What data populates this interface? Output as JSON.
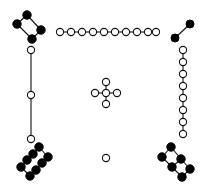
{
  "figure": {
    "width": 208,
    "height": 194,
    "background": "#ffffff",
    "colors": {
      "stroke": "#111111",
      "filled": "#000000",
      "open": "#ffffff"
    },
    "components": [
      {
        "name": "top-left-filled-ring",
        "node_style": "filled",
        "r": 4.2,
        "nodes": [
          [
            27,
            15
          ],
          [
            17,
            24
          ],
          [
            41,
            30
          ],
          [
            32,
            39
          ]
        ],
        "edges": [
          [
            0,
            1
          ],
          [
            0,
            2
          ],
          [
            1,
            3
          ],
          [
            2,
            3
          ]
        ]
      },
      {
        "name": "top-horizontal-chain",
        "node_style": "open",
        "r": 3.6,
        "nodes": [
          [
            60,
            32
          ],
          [
            71,
            32
          ],
          [
            82,
            32
          ],
          [
            93,
            32
          ],
          [
            104,
            32
          ],
          [
            115,
            32
          ],
          [
            126,
            32
          ],
          [
            137,
            32
          ],
          [
            148,
            32
          ],
          [
            156,
            32
          ]
        ],
        "edges": [
          [
            0,
            1
          ],
          [
            1,
            2
          ],
          [
            2,
            3
          ],
          [
            3,
            4
          ],
          [
            4,
            5
          ],
          [
            5,
            6
          ],
          [
            6,
            7
          ],
          [
            7,
            8
          ],
          [
            8,
            9
          ]
        ]
      },
      {
        "name": "top-right-filled-pair",
        "node_style": "filled",
        "r": 4.0,
        "nodes": [
          [
            175,
            38
          ],
          [
            190,
            24
          ]
        ],
        "edges": [
          [
            0,
            1
          ]
        ]
      },
      {
        "name": "left-vertical-chain",
        "node_style": "open",
        "r": 3.6,
        "nodes": [
          [
            31,
            50
          ],
          [
            31,
            95
          ],
          [
            31,
            139
          ]
        ],
        "edges": [
          [
            0,
            1
          ],
          [
            1,
            2
          ]
        ]
      },
      {
        "name": "right-vertical-chain",
        "node_style": "open",
        "r": 3.6,
        "nodes": [
          [
            183,
            50
          ],
          [
            183,
            62
          ],
          [
            183,
            74
          ],
          [
            183,
            86
          ],
          [
            183,
            98
          ],
          [
            183,
            110
          ],
          [
            183,
            122
          ],
          [
            183,
            134
          ]
        ],
        "edges": [
          [
            0,
            1
          ],
          [
            1,
            2
          ],
          [
            2,
            3
          ],
          [
            3,
            4
          ],
          [
            4,
            5
          ],
          [
            5,
            6
          ],
          [
            6,
            7
          ]
        ]
      },
      {
        "name": "center-cross",
        "node_style": "open",
        "r": 3.6,
        "nodes": [
          [
            106,
            93
          ],
          [
            106,
            82
          ],
          [
            95,
            93
          ],
          [
            117,
            93
          ],
          [
            106,
            104
          ]
        ],
        "edges": [
          [
            0,
            1
          ],
          [
            0,
            2
          ],
          [
            0,
            3
          ],
          [
            0,
            4
          ]
        ]
      },
      {
        "name": "bottom-left-filled-ladder",
        "node_style": "filled",
        "r": 4.2,
        "nodes": [
          [
            39,
            147
          ],
          [
            33,
            154
          ],
          [
            27,
            160
          ],
          [
            21,
            167
          ],
          [
            48,
            157
          ],
          [
            42,
            163
          ],
          [
            36,
            170
          ],
          [
            30,
            176
          ]
        ],
        "edges": [
          [
            0,
            1
          ],
          [
            1,
            2
          ],
          [
            2,
            3
          ],
          [
            4,
            5
          ],
          [
            5,
            6
          ],
          [
            6,
            7
          ],
          [
            0,
            4
          ],
          [
            3,
            7
          ]
        ]
      },
      {
        "name": "bottom-right-filled-ring",
        "node_style": "filled",
        "r": 4.2,
        "nodes": [
          [
            171,
            147
          ],
          [
            162,
            157
          ],
          [
            181,
            159
          ],
          [
            172,
            167
          ],
          [
            190,
            169
          ],
          [
            182,
            177
          ]
        ],
        "edges": [
          [
            0,
            1
          ],
          [
            0,
            2
          ],
          [
            1,
            3
          ],
          [
            2,
            3
          ],
          [
            2,
            4
          ],
          [
            3,
            5
          ],
          [
            4,
            5
          ]
        ]
      },
      {
        "name": "bottom-center-isolated-node",
        "node_style": "open",
        "r": 3.6,
        "nodes": [
          [
            106,
            158
          ]
        ],
        "edges": []
      }
    ]
  }
}
